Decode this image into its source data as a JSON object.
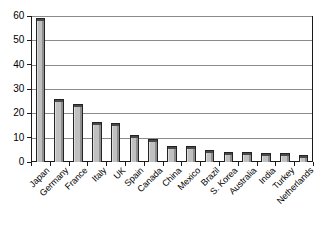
{
  "chart_data": {
    "type": "bar",
    "title": "",
    "subtitle": "",
    "xlabel": "",
    "ylabel": "",
    "categories": [
      "Japan",
      "Germany",
      "France",
      "Italy",
      "UK",
      "Spain",
      "Canada",
      "China",
      "Mexico",
      "Brazil",
      "S. Korea",
      "Australia",
      "India",
      "Turkey",
      "Netherlands"
    ],
    "values": [
      59,
      26,
      24,
      16.5,
      16,
      11,
      9.5,
      6.5,
      6.5,
      4.8,
      4.3,
      4,
      3.5,
      3.5,
      3
    ],
    "ylim": [
      0,
      60
    ],
    "yticks": [
      0,
      10,
      20,
      30,
      40,
      50,
      60
    ],
    "ytick_labels": [
      "0",
      "10",
      "20",
      "30",
      "40",
      "50",
      "60"
    ],
    "grid": true,
    "grid_axis": "y",
    "legend": false,
    "legend_position": "none",
    "bar_fill_color": "#c0c0c0",
    "bar_edge_color": "#232323",
    "gridline_color": "#8a8a8a",
    "axis_color": "#1a1a1a",
    "background_color": "#ffffff",
    "xtick_label_rotation": -45
  }
}
